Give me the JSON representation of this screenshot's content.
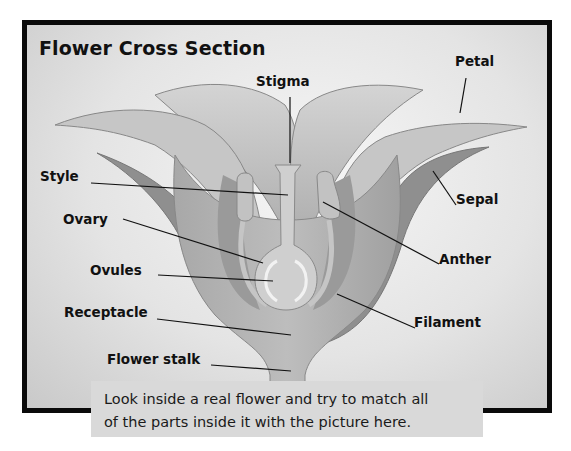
{
  "diagram": {
    "title": "Flower Cross Section",
    "labels": {
      "stigma": "Stigma",
      "petal": "Petal",
      "style": "Style",
      "sepal": "Sepal",
      "ovary": "Ovary",
      "anther": "Anther",
      "ovules": "Ovules",
      "receptacle": "Receptacle",
      "filament": "Filament",
      "flower_stalk": "Flower stalk"
    },
    "caption_lines": [
      "Look inside a real flower and try to match all",
      "of the parts inside it with the picture here."
    ],
    "colors": {
      "frame": "#0a0a0a",
      "background": "#e4e4e4",
      "petal": "#bdbdbd",
      "sepal": "#8f8f8f",
      "caption_bg": "#d9d9d9"
    }
  }
}
